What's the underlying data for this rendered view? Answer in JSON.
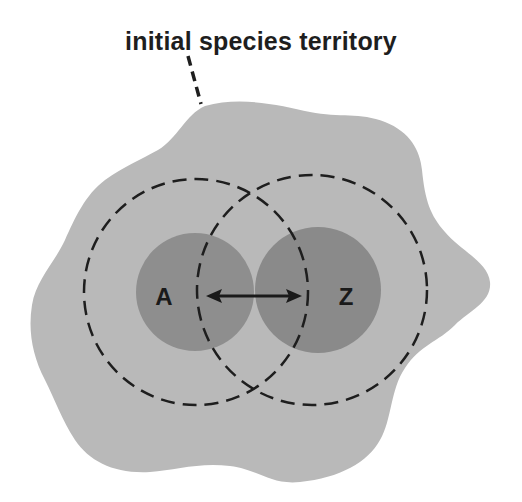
{
  "diagram": {
    "label": "initial species territory",
    "populations": [
      {
        "id": "A",
        "label": "A"
      },
      {
        "id": "Z",
        "label": "Z"
      }
    ],
    "colors": {
      "background": "#ffffff",
      "territory_fill": "#b9b9b9",
      "population_fill": "#8c8c8c",
      "dashed_stroke": "#1e1e1e",
      "text": "#1e1e1e"
    }
  }
}
